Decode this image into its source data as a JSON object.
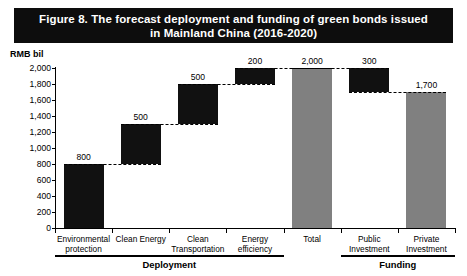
{
  "figure": {
    "title": "Figure 8.  The forecast deployment and funding of green bonds issued in Mainland China (2016-2020)",
    "title_line1": "Figure 8.  The forecast deployment and funding of green bonds issued",
    "title_line2": "in Mainland China (2016-2020)",
    "banner_background": "#0d0d0d",
    "banner_text_color": "#ffffff"
  },
  "colors": {
    "component_bar": "#111111",
    "total_bar": "#808080",
    "axis": "#000000",
    "background": "#ffffff"
  },
  "axis_unit_label": "RMB bil",
  "chart_data": {
    "type": "bar",
    "subtype": "waterfall",
    "title": "Figure 8.  The forecast deployment and funding of green bonds issued in Mainland China (2016-2020)",
    "xlabel": "",
    "ylabel": "RMB bil",
    "ylim": [
      0,
      2000
    ],
    "ytick_step": 200,
    "grid": false,
    "legend": "none",
    "ytick_labels": [
      "0",
      "200",
      "400",
      "600",
      "800",
      "1,000",
      "1,200",
      "1,400",
      "1,600",
      "1,800",
      "2,000"
    ],
    "ytick_values": [
      0,
      200,
      400,
      600,
      800,
      1000,
      1200,
      1400,
      1600,
      1800,
      2000
    ],
    "categories": [
      "Environmental protection",
      "Clean Energy",
      "Clean Transportation",
      "Energy efficiency",
      "Total",
      "Public Investment",
      "Private Investment"
    ],
    "values": [
      800,
      500,
      500,
      200,
      2000,
      300,
      1700
    ],
    "data_labels": [
      "800",
      "500",
      "500",
      "200",
      "2,000",
      "300",
      "1,700"
    ],
    "bases": [
      0,
      800,
      1300,
      1800,
      0,
      1700,
      0
    ],
    "tops": [
      800,
      1300,
      1800,
      2000,
      2000,
      2000,
      1700
    ],
    "bar_kinds": [
      "component",
      "component",
      "component",
      "component",
      "total",
      "component",
      "total"
    ],
    "connectors": [
      {
        "from_category": "Environmental protection",
        "to_category": "Clean Energy",
        "level": 800
      },
      {
        "from_category": "Clean Energy",
        "to_category": "Clean Transportation",
        "level": 1300
      },
      {
        "from_category": "Clean Transportation",
        "to_category": "Energy efficiency",
        "level": 1800
      },
      {
        "from_category": "Energy efficiency",
        "to_category": "Total",
        "level": 2000
      },
      {
        "from_category": "Total",
        "to_category": "Public Investment",
        "level": 2000
      },
      {
        "from_category": "Public Investment",
        "to_category": "Private Investment",
        "level": 1700
      }
    ],
    "groups": [
      {
        "label": "Deployment",
        "categories": [
          "Environmental protection",
          "Clean Energy",
          "Clean Transportation",
          "Energy efficiency"
        ]
      },
      {
        "label": "Funding",
        "categories": [
          "Public Investment",
          "Private Investment"
        ]
      }
    ]
  },
  "category_label_lines": [
    [
      "Environmental",
      "protection"
    ],
    [
      "Clean Energy",
      ""
    ],
    [
      "Clean",
      "Transportation"
    ],
    [
      "Energy",
      "efficiency"
    ],
    [
      "Total",
      ""
    ],
    [
      "Public",
      "Investment"
    ],
    [
      "Private",
      "Investment"
    ]
  ],
  "groups": {
    "deployment_label": "Deployment",
    "funding_label": "Funding"
  }
}
